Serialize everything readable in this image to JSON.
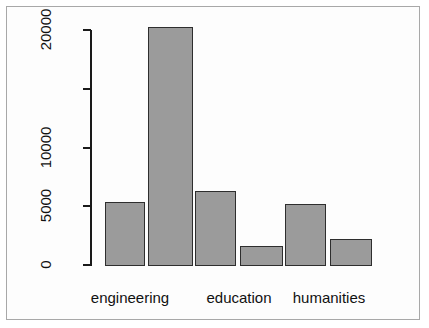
{
  "chart_data": {
    "type": "bar",
    "title": "",
    "xlabel": "",
    "ylabel": "",
    "categories": [
      "engineering",
      "engineering",
      "education",
      "education",
      "humanities",
      "humanities"
    ],
    "group_labels": [
      "engineering",
      "education",
      "humanities"
    ],
    "values": [
      5400,
      20250,
      6300,
      1620,
      5200,
      2200
    ],
    "ylim": [
      0,
      20000
    ],
    "y_ticks": [
      0,
      5000,
      10000,
      15000,
      20000
    ],
    "y_tick_labels": [
      "0",
      "5000",
      "10000",
      "",
      "20000"
    ],
    "grid": false,
    "legend": "none",
    "bar_color": "#9b9b9b",
    "bar_border_color": "#2e2e2e",
    "axis_color": "#1a1a1a",
    "frame_color": "#a8a8a8",
    "background": "#ffffff"
  },
  "axis": {
    "y_labels": [
      {
        "text": "0",
        "value": 0
      },
      {
        "text": "5000",
        "value": 5000
      },
      {
        "text": "10000",
        "value": 10000
      },
      {
        "text": "20000",
        "value": 20000
      }
    ]
  },
  "bars": [
    {
      "label": "engineering",
      "value": 5400,
      "left": 105,
      "width": 40
    },
    {
      "label": "engineering",
      "value": 20250,
      "left": 148,
      "width": 45
    },
    {
      "label": "education",
      "value": 6300,
      "left": 195,
      "width": 41
    },
    {
      "label": "education",
      "value": 1620,
      "left": 240,
      "width": 43
    },
    {
      "label": "humanities",
      "value": 5200,
      "left": 285,
      "width": 41
    },
    {
      "label": "humanities",
      "value": 2200,
      "left": 330,
      "width": 42
    }
  ],
  "x_labels": [
    {
      "text": "engineering",
      "center": 130
    },
    {
      "text": "education",
      "center": 239
    },
    {
      "text": "humanities",
      "center": 329
    }
  ]
}
